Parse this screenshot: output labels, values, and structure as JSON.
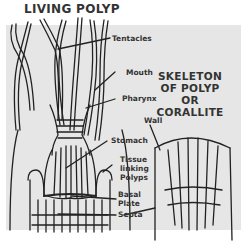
{
  "titles": {
    "living_polyp": "LIVING POLYP",
    "skeleton": [
      "SKELETON",
      "OF POLYP",
      "OR",
      "CORALLITE"
    ]
  },
  "labels": {
    "tentacles": "Tentacles",
    "mouth": "Mouth",
    "pharynx": "Pharynx",
    "stomach": "Stomach",
    "tissue_linking_polyps": [
      "Tissue",
      "linking",
      "Polyps"
    ],
    "basal_plate": [
      "Basal",
      "Plate"
    ],
    "septa": "Septa",
    "wall": "Wall"
  },
  "colors": {
    "background": "#ffffff",
    "panel": "#e6e6e6",
    "ink": "#222222",
    "text": "#333333"
  }
}
